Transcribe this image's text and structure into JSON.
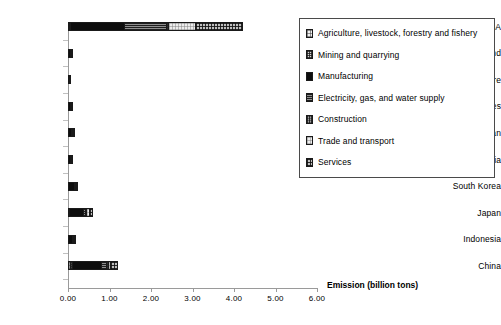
{
  "chart_data": {
    "type": "bar",
    "subtype": "horizontal-stacked",
    "title": "",
    "xlabel": "Emission (billion tons)",
    "ylabel": "",
    "xlim": [
      0.0,
      6.0
    ],
    "xticks": [
      "0.00",
      "1.00",
      "2.00",
      "3.00",
      "4.00",
      "5.00",
      "6.00"
    ],
    "xtick_values": [
      0.0,
      1.0,
      2.0,
      3.0,
      4.0,
      5.0,
      6.0
    ],
    "grid": false,
    "legend_position": "right",
    "categories": [
      "USA",
      "Thailand",
      "Singapore",
      "Philippines",
      "Taiwan",
      "Malaysia",
      "South Korea",
      "Japan",
      "Indonesia",
      "China"
    ],
    "series": [
      {
        "name": "Agriculture, livestock, forestry and fishery",
        "pattern": "fine-grid-light",
        "values": [
          0.02,
          0.005,
          0.002,
          0.004,
          0.004,
          0.004,
          0.006,
          0.01,
          0.006,
          0.06
        ]
      },
      {
        "name": "Mining and quarrying",
        "pattern": "dense-dot-grey",
        "values": [
          0.02,
          0.002,
          0.001,
          0.002,
          0.003,
          0.003,
          0.004,
          0.01,
          0.004,
          0.03
        ]
      },
      {
        "name": "Manufacturing",
        "pattern": "solid-black",
        "values": [
          1.3,
          0.05,
          0.02,
          0.04,
          0.07,
          0.05,
          0.14,
          0.33,
          0.09,
          0.7
        ]
      },
      {
        "name": "Electricity, gas, and water supply",
        "pattern": "horizontal-line-grey",
        "values": [
          1.02,
          0.01,
          0.004,
          0.008,
          0.02,
          0.01,
          0.02,
          0.07,
          0.02,
          0.13
        ]
      },
      {
        "name": "Construction",
        "pattern": "vertical-line-grey",
        "values": [
          0.06,
          0.002,
          0.001,
          0.002,
          0.003,
          0.002,
          0.004,
          0.02,
          0.004,
          0.04
        ]
      },
      {
        "name": "Trade and transport",
        "pattern": "pale-grid",
        "values": [
          0.65,
          0.008,
          0.004,
          0.008,
          0.01,
          0.008,
          0.02,
          0.06,
          0.01,
          0.06
        ]
      },
      {
        "name": "Services",
        "pattern": "cross-hatch-dark",
        "values": [
          1.15,
          0.008,
          0.004,
          0.008,
          0.01,
          0.008,
          0.02,
          0.1,
          0.01,
          0.18
        ]
      }
    ],
    "totals": [
      4.24,
      0.085,
      0.036,
      0.072,
      0.12,
      0.085,
      0.214,
      0.6,
      0.144,
      1.2
    ],
    "units": "billion tons"
  },
  "legend": {
    "items": [
      {
        "label": "Agriculture, livestock, forestry and fishery",
        "swatch": "p-agri"
      },
      {
        "label": "Mining and quarrying",
        "swatch": "p-mining"
      },
      {
        "label": "Manufacturing",
        "swatch": "p-manu"
      },
      {
        "label": "Electricity, gas, and water supply",
        "swatch": "p-elec"
      },
      {
        "label": "Construction",
        "swatch": "p-constr"
      },
      {
        "label": "Trade and transport",
        "swatch": "p-trade"
      },
      {
        "label": "Services",
        "swatch": "p-serv"
      }
    ]
  }
}
